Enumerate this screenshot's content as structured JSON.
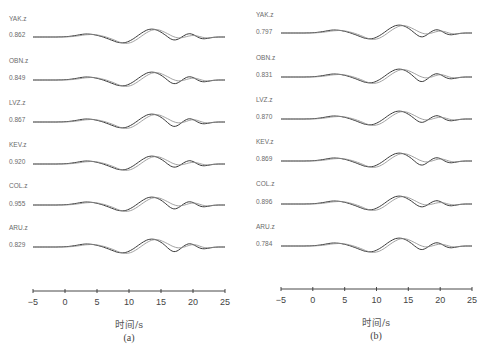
{
  "chart_data": [
    {
      "type": "line",
      "panel": "(a)",
      "title": "",
      "xlabel": "时间/s",
      "ylabel": "",
      "xlim": [
        -5,
        25
      ],
      "xticks": [
        -5,
        0,
        5,
        10,
        15,
        20,
        25
      ],
      "legend": [
        "observed",
        "synthetic"
      ],
      "series": [
        {
          "name": "YAK.z",
          "cc": "0.862"
        },
        {
          "name": "OBN.z",
          "cc": "0.849"
        },
        {
          "name": "LVZ.z",
          "cc": "0.867"
        },
        {
          "name": "KEV.z",
          "cc": "0.920"
        },
        {
          "name": "COL.z",
          "cc": "0.955"
        },
        {
          "name": "ARU.z",
          "cc": "0.829"
        }
      ]
    },
    {
      "type": "line",
      "panel": "(b)",
      "title": "",
      "xlabel": "时间/s",
      "ylabel": "",
      "xlim": [
        -5,
        25
      ],
      "xticks": [
        -5,
        0,
        5,
        10,
        15,
        20,
        25
      ],
      "legend": [
        "observed",
        "synthetic"
      ],
      "series": [
        {
          "name": "YAK.z",
          "cc": "0.797"
        },
        {
          "name": "OBN.z",
          "cc": "0.831"
        },
        {
          "name": "LVZ.z",
          "cc": "0.870"
        },
        {
          "name": "KEV.z",
          "cc": "0.869"
        },
        {
          "name": "COL.z",
          "cc": "0.896"
        },
        {
          "name": "ARU.z",
          "cc": "0.784"
        }
      ]
    }
  ],
  "panels": {
    "a": {
      "caption": "(a)",
      "xlabel": "时间/s",
      "ticks": [
        "−5",
        "0",
        "5",
        "10",
        "15",
        "20",
        "25"
      ],
      "stations": [
        {
          "name": "YAK.z",
          "cc": "0.862"
        },
        {
          "name": "OBN.z",
          "cc": "0.849"
        },
        {
          "name": "LVZ.z",
          "cc": "0.867"
        },
        {
          "name": "KEV.z",
          "cc": "0.920"
        },
        {
          "name": "COL.z",
          "cc": "0.955"
        },
        {
          "name": "ARU.z",
          "cc": "0.829"
        }
      ]
    },
    "b": {
      "caption": "(b)",
      "xlabel": "时间/s",
      "ticks": [
        "−5",
        "0",
        "5",
        "10",
        "15",
        "20",
        "25"
      ],
      "stations": [
        {
          "name": "YAK.z",
          "cc": "0.797"
        },
        {
          "name": "OBN.z",
          "cc": "0.831"
        },
        {
          "name": "LVZ.z",
          "cc": "0.870"
        },
        {
          "name": "KEV.z",
          "cc": "0.869"
        },
        {
          "name": "COL.z",
          "cc": "0.896"
        },
        {
          "name": "ARU.z",
          "cc": "0.784"
        }
      ]
    }
  },
  "colors": {
    "observed": "#3a3a3a",
    "synthetic": "#8a8a8a",
    "axis": "#333333"
  }
}
